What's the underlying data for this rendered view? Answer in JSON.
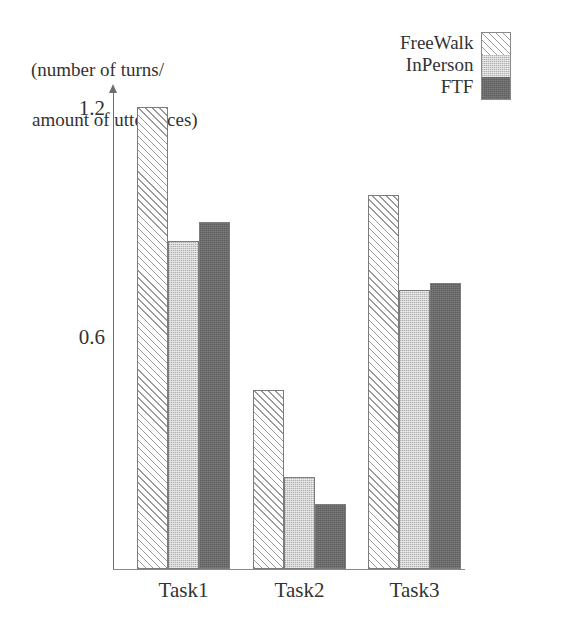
{
  "chart_data": {
    "type": "bar",
    "title": "",
    "xlabel": "",
    "ylabel": "(number of turns/\namount of utterances)",
    "ylabel_line1": "(number of turns/",
    "ylabel_line2": "amount of utterances)",
    "categories": [
      "Task1",
      "Task2",
      "Task3"
    ],
    "series": [
      {
        "name": "FreeWalk",
        "values": [
          1.21,
          0.47,
          0.98
        ],
        "fill": "diagonal-hatch",
        "color": "#ffffff"
      },
      {
        "name": "InPerson",
        "values": [
          0.86,
          0.24,
          0.73
        ],
        "fill": "light-gray-stipple",
        "color": "#d2d2d2"
      },
      {
        "name": "FTF",
        "values": [
          0.91,
          0.17,
          0.75
        ],
        "fill": "dark-gray-solid",
        "color": "#6b6b6b"
      }
    ],
    "yticks": [
      0.6,
      1.2
    ],
    "ytick_labels": [
      "0.6",
      "1.2"
    ],
    "ylim": [
      0,
      1.29
    ],
    "grid": false,
    "legend_position": "top-right",
    "legend_entries": [
      "FreeWalk",
      "InPerson",
      "FTF"
    ]
  }
}
